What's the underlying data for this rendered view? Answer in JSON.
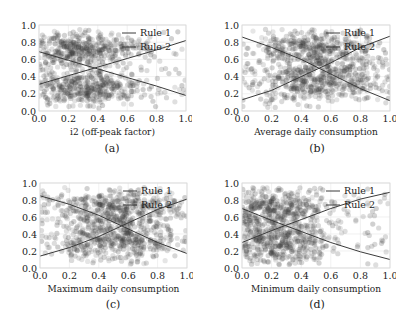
{
  "chart_data": [
    {
      "type": "scatter",
      "panel": "a",
      "caption": "(a)",
      "xlabel": "i2 (off-peak factor)",
      "ylabel": "",
      "xlim": [
        0.0,
        1.0
      ],
      "ylim": [
        0.0,
        1.0
      ],
      "xticks": [
        "0.0",
        "0.2",
        "0.4",
        "0.6",
        "0.8",
        "1.0"
      ],
      "yticks": [
        "0.0",
        "0.2",
        "0.4",
        "0.6",
        "0.8",
        "1.0"
      ],
      "grid": true,
      "legend": [
        "Rule 1",
        "Rule 2"
      ],
      "legend_position": "upper right",
      "series": [
        {
          "name": "Rule 1",
          "type": "line",
          "x": [
            0.0,
            0.2,
            0.4,
            0.6,
            0.8,
            1.0
          ],
          "y": [
            0.69,
            0.59,
            0.49,
            0.39,
            0.29,
            0.18
          ]
        },
        {
          "name": "Rule 2",
          "type": "line",
          "x": [
            0.0,
            0.2,
            0.4,
            0.6,
            0.8,
            1.0
          ],
          "y": [
            0.31,
            0.41,
            0.51,
            0.61,
            0.71,
            0.82
          ]
        }
      ],
      "scatter": {
        "n": 900,
        "x_center": 0.28,
        "x_spread": 0.2,
        "x_max": 1.0,
        "clusters_y": [
          0.72,
          0.28
        ],
        "y_spread": 0.11,
        "seed": 11
      }
    },
    {
      "type": "scatter",
      "panel": "b",
      "caption": "(b)",
      "xlabel": "Average daily consumption",
      "ylabel": "",
      "xlim": [
        0.0,
        1.0
      ],
      "ylim": [
        0.0,
        1.0
      ],
      "xticks": [
        "0.0",
        "0.2",
        "0.4",
        "0.6",
        "0.8",
        "1.0"
      ],
      "yticks": [
        "0.0",
        "0.2",
        "0.4",
        "0.6",
        "0.8",
        "1.0"
      ],
      "grid": true,
      "legend": [
        "Rule 1",
        "Rule 2"
      ],
      "legend_position": "upper right",
      "series": [
        {
          "name": "Rule 1",
          "type": "line",
          "x": [
            0.0,
            0.2,
            0.4,
            0.6,
            0.8,
            1.0
          ],
          "y": [
            0.86,
            0.74,
            0.6,
            0.43,
            0.26,
            0.12
          ]
        },
        {
          "name": "Rule 2",
          "type": "line",
          "x": [
            0.0,
            0.2,
            0.4,
            0.6,
            0.8,
            1.0
          ],
          "y": [
            0.13,
            0.24,
            0.4,
            0.56,
            0.74,
            0.87
          ]
        }
      ],
      "scatter": {
        "n": 900,
        "x_center": 0.5,
        "x_spread": 0.22,
        "x_max": 1.0,
        "clusters_y": [
          0.7,
          0.32
        ],
        "y_spread": 0.13,
        "seed": 23
      }
    },
    {
      "type": "scatter",
      "panel": "c",
      "caption": "(c)",
      "xlabel": "Maximum daily consumption",
      "ylabel": "",
      "xlim": [
        0.0,
        1.0
      ],
      "ylim": [
        0.0,
        1.0
      ],
      "xticks": [
        "0.0",
        "0.2",
        "0.4",
        "0.6",
        "0.8",
        "1.0"
      ],
      "yticks": [
        "0.0",
        "0.2",
        "0.4",
        "0.6",
        "0.8",
        "1.0"
      ],
      "grid": true,
      "legend": [
        "Rule 1",
        "Rule 2"
      ],
      "legend_position": "upper right",
      "series": [
        {
          "name": "Rule 1",
          "type": "line",
          "x": [
            0.0,
            0.2,
            0.4,
            0.6,
            0.8,
            1.0
          ],
          "y": [
            0.85,
            0.75,
            0.62,
            0.46,
            0.3,
            0.17
          ]
        },
        {
          "name": "Rule 2",
          "type": "line",
          "x": [
            0.0,
            0.2,
            0.4,
            0.6,
            0.8,
            1.0
          ],
          "y": [
            0.14,
            0.24,
            0.37,
            0.53,
            0.69,
            0.81
          ]
        }
      ],
      "scatter": {
        "n": 900,
        "x_center": 0.5,
        "x_spread": 0.22,
        "x_max": 1.0,
        "clusters_y": [
          0.7,
          0.32
        ],
        "y_spread": 0.13,
        "seed": 37
      }
    },
    {
      "type": "scatter",
      "panel": "d",
      "caption": "(d)",
      "xlabel": "Minimum daily consumption",
      "ylabel": "",
      "xlim": [
        0.0,
        1.0
      ],
      "ylim": [
        0.0,
        1.0
      ],
      "xticks": [
        "0.0",
        "0.2",
        "0.4",
        "0.6",
        "0.8",
        "1.0"
      ],
      "yticks": [
        "0.0",
        "0.2",
        "0.4",
        "0.6",
        "0.8",
        "1.0"
      ],
      "grid": true,
      "legend": [
        "Rule 1",
        "Rule 2"
      ],
      "legend_position": "upper right",
      "series": [
        {
          "name": "Rule 1",
          "type": "line",
          "x": [
            0.0,
            0.2,
            0.4,
            0.6,
            0.8,
            1.0
          ],
          "y": [
            0.7,
            0.56,
            0.43,
            0.3,
            0.19,
            0.1
          ]
        },
        {
          "name": "Rule 2",
          "type": "line",
          "x": [
            0.0,
            0.2,
            0.4,
            0.6,
            0.8,
            1.0
          ],
          "y": [
            0.3,
            0.44,
            0.57,
            0.7,
            0.81,
            0.89
          ]
        }
      ],
      "scatter": {
        "n": 900,
        "x_center": 0.22,
        "x_spread": 0.18,
        "x_max": 1.0,
        "clusters_y": [
          0.68,
          0.3
        ],
        "y_spread": 0.14,
        "seed": 51
      }
    }
  ],
  "style": {
    "point_color": "#3a3a3a",
    "line_rule1": "#3b3b3b",
    "line_rule2": "#3b3b3b",
    "grid_color": "#e6e6e6",
    "frame_color": "#d8d8d8"
  }
}
